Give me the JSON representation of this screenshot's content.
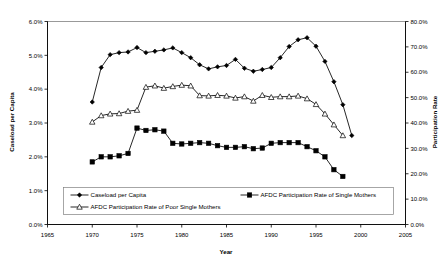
{
  "chart_data": {
    "type": "line",
    "title": "",
    "xlabel": "Year",
    "ylabel": "Caseload per Capita",
    "y2label": "Participation Rate",
    "xlim": [
      1965,
      2005
    ],
    "ylim": [
      0,
      6
    ],
    "y2lim": [
      0,
      80
    ],
    "xticks": [
      1965,
      1970,
      1975,
      1980,
      1985,
      1990,
      1995,
      2000,
      2005
    ],
    "xtick_labels": [
      "1965",
      "1970",
      "1975",
      "1980",
      "1985",
      "1990",
      "1995",
      "2000",
      "2005"
    ],
    "yticks": [
      0,
      1,
      2,
      3,
      4,
      5,
      6
    ],
    "ytick_labels": [
      "0.0%",
      "1.0%",
      "2.0%",
      "3.0%",
      "4.0%",
      "5.0%",
      "6.0%"
    ],
    "y2ticks": [
      0,
      10,
      20,
      30,
      40,
      50,
      60,
      70,
      80
    ],
    "y2tick_labels": [
      "0.0%",
      "10.0%",
      "20.0%",
      "30.0%",
      "40.0%",
      "50.0%",
      "60.0%",
      "70.0%",
      "80.0%"
    ],
    "grid": false,
    "legend_position": "inside-bottom-left",
    "series": [
      {
        "name": "Caseload per Capita",
        "marker": "diamond",
        "axis": "left",
        "x": [
          1970,
          1971,
          1972,
          1973,
          1974,
          1975,
          1976,
          1977,
          1978,
          1979,
          1980,
          1981,
          1982,
          1983,
          1984,
          1985,
          1986,
          1987,
          1988,
          1989,
          1990,
          1991,
          1992,
          1993,
          1994,
          1995,
          1996,
          1997,
          1998
        ],
        "y": [
          3.62,
          4.64,
          5.02,
          5.08,
          5.1,
          5.23,
          5.08,
          5.12,
          5.16,
          5.22,
          5.08,
          4.93,
          4.72,
          4.6,
          4.66,
          4.7,
          4.88,
          4.62,
          4.53,
          4.58,
          4.64,
          4.93,
          5.26,
          5.46,
          5.52,
          5.27,
          4.82,
          4.22,
          3.54
        ],
        "y_end_extra": [
          2.63
        ]
      },
      {
        "name": "AFDC Participation Rate of Poor Single Mothers",
        "marker": "triangle",
        "axis": "left",
        "x": [
          1970,
          1971,
          1972,
          1973,
          1974,
          1975,
          1976,
          1977,
          1978,
          1979,
          1980,
          1981,
          1982,
          1983,
          1984,
          1985,
          1986,
          1987,
          1988,
          1989,
          1990,
          1991,
          1992,
          1993,
          1994,
          1995,
          1996,
          1997,
          1998
        ],
        "y": [
          3.03,
          3.22,
          3.27,
          3.28,
          3.35,
          3.38,
          4.06,
          4.1,
          4.03,
          4.08,
          4.12,
          4.1,
          3.81,
          3.8,
          3.82,
          3.8,
          3.74,
          3.78,
          3.65,
          3.82,
          3.76,
          3.78,
          3.78,
          3.8,
          3.72,
          3.55,
          3.27,
          2.95,
          2.63
        ]
      },
      {
        "name": "AFDC Participation Rate of Single Mothers",
        "marker": "square",
        "axis": "left",
        "x": [
          1970,
          1971,
          1972,
          1973,
          1974,
          1975,
          1976,
          1977,
          1978,
          1979,
          1980,
          1981,
          1982,
          1983,
          1984,
          1985,
          1986,
          1987,
          1988,
          1989,
          1990,
          1991,
          1992,
          1993,
          1994,
          1995,
          1996,
          1997,
          1998
        ],
        "y": [
          1.85,
          2.0,
          2.0,
          2.03,
          2.1,
          2.85,
          2.78,
          2.8,
          2.76,
          2.4,
          2.38,
          2.4,
          2.42,
          2.4,
          2.33,
          2.28,
          2.28,
          2.3,
          2.24,
          2.26,
          2.4,
          2.42,
          2.42,
          2.42,
          2.3,
          2.18,
          2.0,
          1.62,
          1.42
        ]
      }
    ],
    "legend": [
      {
        "label": "Caseload per Capita",
        "marker": "diamond"
      },
      {
        "label": "AFDC Participation Rate of Single Mothers",
        "marker": "square"
      },
      {
        "label": "AFDC Participation Rate of Poor Single Mothers",
        "marker": "triangle"
      }
    ],
    "colors": {
      "line": "#000000",
      "marker_fill_solid": "#000000",
      "marker_fill_hollow": "#ffffff",
      "axis": "#000000",
      "plot_border": "#808080",
      "background": "#ffffff"
    }
  }
}
